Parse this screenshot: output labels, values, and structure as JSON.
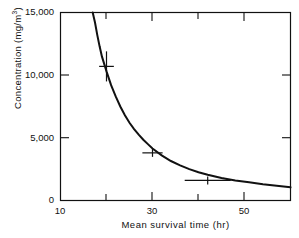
{
  "figure": {
    "background_color": "#ffffff",
    "ink_color": "#111111"
  },
  "axes": {
    "x_title": "Mean survival time (hr)",
    "y_title_prefix": "Concentration  (mg/m",
    "y_title_sup": "3",
    "y_title_suffix": ")",
    "x_tick_labels": [
      "10",
      "30",
      "50"
    ],
    "y_tick_labels": [
      "15,000",
      "10,000",
      "5,000",
      "0"
    ]
  },
  "chart_data": {
    "type": "line",
    "title": "",
    "xlabel": "Mean survival time (hr)",
    "ylabel": "Concentration (mg/m3)",
    "xlim": [
      10,
      60
    ],
    "ylim": [
      0,
      15000
    ],
    "grid": false,
    "legend": null,
    "x_major_ticks": [
      10,
      30,
      50
    ],
    "x_minor_ticks": [
      20,
      40,
      60
    ],
    "y_ticks": [
      0,
      5000,
      10000,
      15000
    ],
    "series": [
      {
        "name": "fitted curve",
        "type": "line",
        "comment": "hyperbolic decay c = k / (t - t0)",
        "x": [
          17.0,
          17.5,
          18.0,
          18.5,
          19.0,
          20.0,
          21.0,
          22.0,
          23.0,
          24.0,
          25.0,
          26.0,
          27.0,
          28.0,
          29.0,
          30.0,
          32.0,
          34.0,
          36.0,
          38.0,
          40.0,
          42.0,
          45.0,
          48.0,
          51.0,
          54.0,
          57.0,
          60.0
        ],
        "y": [
          15000,
          14200,
          13200,
          12300,
          11500,
          10300,
          9200,
          8300,
          7500,
          6800,
          6200,
          5700,
          5250,
          4850,
          4500,
          4150,
          3600,
          3150,
          2800,
          2500,
          2250,
          2050,
          1800,
          1600,
          1450,
          1300,
          1180,
          1050
        ]
      },
      {
        "name": "observations",
        "type": "scatter",
        "marker": "plus",
        "points": [
          {
            "x": 20.0,
            "y": 10700,
            "xerr": 1.6,
            "yerr": 1200,
            "has_vertical_error_bar": true
          },
          {
            "x": 30.0,
            "y": 3800,
            "xerr": 2.2,
            "yerr": 0,
            "has_vertical_error_bar": false
          },
          {
            "x": 42.0,
            "y": 1600,
            "xerr": 5.0,
            "yerr": 0,
            "has_vertical_error_bar": false
          }
        ]
      }
    ]
  }
}
